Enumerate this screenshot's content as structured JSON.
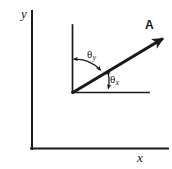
{
  "figure": {
    "type": "vector-angle-diagram",
    "background_color": "#ffffff",
    "ink_color": "#1a1a1a"
  },
  "outer_axes": {
    "y_label": "y",
    "x_label": "x",
    "origin": {
      "x": 32,
      "y": 149
    },
    "y_axis_top": {
      "x": 32,
      "y": 11
    },
    "x_axis_right": {
      "x": 168,
      "y": 149
    },
    "stroke_width": 2.0
  },
  "inner_axes": {
    "origin": {
      "x": 72,
      "y": 93
    },
    "y_axis_top": {
      "x": 72,
      "y": 25
    },
    "x_axis_right": {
      "x": 149,
      "y": 93
    },
    "stroke_width": 1.6
  },
  "vector": {
    "label": "A",
    "label_style": "bold",
    "tail": {
      "x": 72,
      "y": 93
    },
    "tip": {
      "x": 167,
      "y": 36
    },
    "stroke_width": 3.2,
    "arrowhead": "filled-triangle"
  },
  "angles": [
    {
      "name": "theta-y",
      "symbol": "θ",
      "subscript": "y",
      "measured_from": "inner-y-axis",
      "measured_to": "vector",
      "arc_radius": 34,
      "arrowheads": "both-ends",
      "label_position": {
        "x": 87,
        "y": 49
      }
    },
    {
      "name": "theta-x",
      "symbol": "θ",
      "subscript": "x",
      "measured_from": "vector",
      "measured_to": "inner-x-axis",
      "arc_radius": 36,
      "arrowheads": "both-ends",
      "label_position": {
        "x": 110,
        "y": 74
      }
    }
  ]
}
